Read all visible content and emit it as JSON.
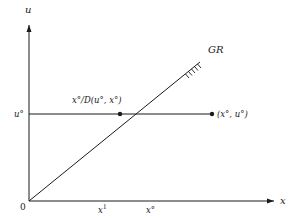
{
  "diagram": {
    "axes": {
      "x_label": "x",
      "y_label": "u",
      "origin_label": "0"
    },
    "curve": {
      "label": "GR",
      "description": "ray from origin with hatching near its upper end"
    },
    "points": {
      "intersection_label": "x°/D(u°, x°)",
      "point_label": "(x°, u°)"
    },
    "ticks": {
      "u_tick": "u°",
      "x1_base": "x",
      "x1_sup": "1",
      "x0": "x°"
    },
    "colors": {
      "line": "#1a1a1a",
      "background": "#ffffff"
    }
  }
}
